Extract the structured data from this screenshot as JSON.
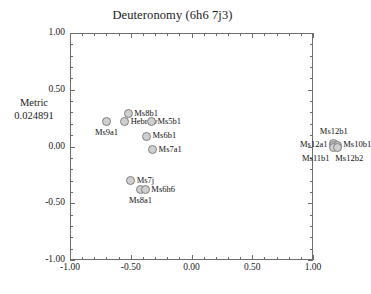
{
  "chart_data": {
    "type": "scatter",
    "title": "Deuteronomy (6h6 7j3)",
    "xlabel": "",
    "ylabel": "",
    "metric_label": "Metric",
    "metric_value": "0.024891",
    "xlim": [
      -1.0,
      1.0
    ],
    "ylim": [
      -1.0,
      1.0
    ],
    "grid": false,
    "legend": "none",
    "xticks": [
      "-1.00",
      "-0.50",
      "0.00",
      "0.50",
      "1.00"
    ],
    "xtick_values": [
      -1.0,
      -0.5,
      0.0,
      0.5,
      1.0
    ],
    "yticks": [
      "1.00",
      "0.50",
      "0.00",
      "-0.50",
      "-1.00"
    ],
    "ytick_values": [
      1.0,
      0.5,
      0.0,
      -0.5,
      -1.0
    ],
    "minor_ticks_per_interval": 4,
    "marker_style": {
      "shape": "circle",
      "fill": "#cfcfcf",
      "stroke": "#808080"
    },
    "points": [
      {
        "label": "Ms8b1",
        "x": -0.52,
        "y": 0.29,
        "label_pos": "right"
      },
      {
        "label": "Hebrew",
        "x": -0.55,
        "y": 0.22,
        "label_pos": "right"
      },
      {
        "label": "Ms9a1",
        "x": -0.7,
        "y": 0.22,
        "label_pos": "below"
      },
      {
        "label": "Ms5b1",
        "x": -0.33,
        "y": 0.22,
        "label_pos": "right"
      },
      {
        "label": "Ms6b1",
        "x": -0.37,
        "y": 0.09,
        "label_pos": "right"
      },
      {
        "label": "Ms7a1",
        "x": -0.32,
        "y": -0.03,
        "label_pos": "right"
      },
      {
        "label": "Ms7j",
        "x": -0.5,
        "y": -0.3,
        "label_pos": "right"
      },
      {
        "label": "Ms8a1",
        "x": -0.42,
        "y": -0.38,
        "label_pos": "below"
      },
      {
        "label": "Ms6h6",
        "x": -0.38,
        "y": -0.38,
        "label_pos": "right"
      },
      {
        "label": "Ms12b1",
        "x": 1.17,
        "y": 0.03,
        "label_pos": "above"
      },
      {
        "label": "Ms12a1",
        "x": 1.17,
        "y": 0.01,
        "label_pos": "left"
      },
      {
        "label": "Ms10b1",
        "x": 1.2,
        "y": 0.01,
        "label_pos": "right"
      },
      {
        "label": "Ms11b1",
        "x": 1.17,
        "y": -0.01,
        "label_pos": "below-left"
      },
      {
        "label": "Ms12b2",
        "x": 1.2,
        "y": -0.01,
        "label_pos": "below-right"
      }
    ]
  }
}
